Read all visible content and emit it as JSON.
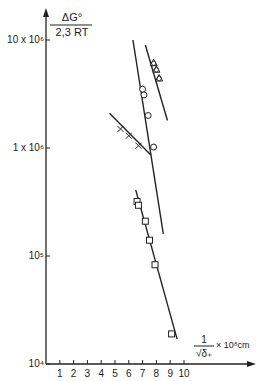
{
  "chart_data": {
    "type": "scatter",
    "title": "",
    "ylabel": {
      "numerator": "ΔG°",
      "denominator": "2,3 RT"
    },
    "xlabel": {
      "numerator": "1",
      "denominator": "√δ₊",
      "suffix": "× 10⁸cm"
    },
    "yscale": "log",
    "ylim": [
      10000,
      10000000
    ],
    "xlim": [
      0,
      10
    ],
    "x_ticks": [
      "1",
      "2",
      "3",
      "4",
      "5",
      "6",
      "7",
      "8",
      "9",
      "10"
    ],
    "y_ticks": [
      {
        "value": 10000000,
        "label": "10 x 10⁶"
      },
      {
        "value": 1000000,
        "label": "1 x 10⁶"
      },
      {
        "value": 100000,
        "label": "10⁵"
      },
      {
        "value": 10000,
        "label": "10⁴"
      }
    ],
    "grid": false,
    "legend": null,
    "series": [
      {
        "name": "circles",
        "marker": "circle",
        "points": [
          [
            7.0,
            3500000
          ],
          [
            7.1,
            3100000
          ],
          [
            7.4,
            2000000
          ],
          [
            7.8,
            1020000
          ]
        ],
        "fit_line": [
          [
            6.3,
            10000000
          ],
          [
            8.5,
            160000
          ]
        ]
      },
      {
        "name": "triangles",
        "marker": "triangle-circle",
        "points": [
          [
            7.8,
            6100000
          ],
          [
            8.0,
            5300000
          ],
          [
            8.2,
            4400000
          ]
        ],
        "fit_line": [
          [
            7.2,
            9000000
          ],
          [
            8.8,
            1800000
          ]
        ]
      },
      {
        "name": "crosses",
        "marker": "cross",
        "points": [
          [
            5.4,
            1500000
          ],
          [
            6.0,
            1300000
          ],
          [
            6.7,
            1050000
          ]
        ],
        "fit_line": [
          [
            4.6,
            2100000
          ],
          [
            7.6,
            860000
          ]
        ]
      },
      {
        "name": "squares",
        "marker": "square",
        "points": [
          [
            6.6,
            320000
          ],
          [
            6.7,
            295000
          ],
          [
            7.2,
            210000
          ],
          [
            7.5,
            140000
          ],
          [
            7.9,
            83000
          ],
          [
            9.1,
            19000
          ]
        ],
        "fit_line": [
          [
            6.5,
            410000
          ],
          [
            9.5,
            17000
          ]
        ]
      }
    ]
  }
}
